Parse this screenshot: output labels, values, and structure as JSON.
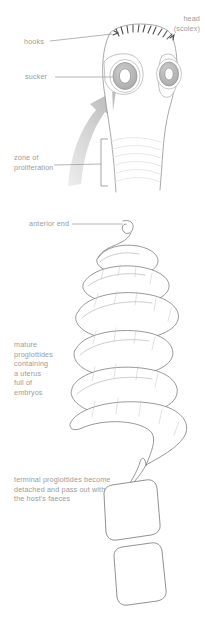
{
  "figure": {
    "background_color": "#ffffff",
    "ink_color": "#595959",
    "label_color": "#9b9b9b",
    "arrow_color": "#c9c9c9",
    "sucker_fill": "#b5b5b5"
  },
  "labels": {
    "head": "head\n(scolex)",
    "hooks": "hooks",
    "sucker": "sucker",
    "zone_of_proliferation": "zone of\nproliferation",
    "anterior_end": "anterior end",
    "mature_proglottides": "mature\nproglottides\ncontaining\na uterus\nfull of\nembryos",
    "terminal_proglottides": "terminal proglottides become\ndetached and pass out with\nthe host's faeces"
  },
  "parts": {
    "scolex": "scolex",
    "hook_crown": "hook-crown",
    "sucker_left": "sucker-left",
    "sucker_right": "sucker-right",
    "neck": "neck",
    "growth_arrow": "growth-arrow",
    "zone_bracket": "zone-bracket",
    "strobila": "strobila-ribbon",
    "detached_segment_1": "detached-proglottid-upper",
    "detached_segment_2": "detached-proglottid-lower"
  },
  "counts": {
    "suckers_visible": 2,
    "detached_segments": 2
  }
}
